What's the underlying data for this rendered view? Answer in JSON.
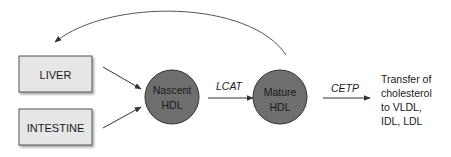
{
  "diagram": {
    "sources": [
      {
        "id": "liver",
        "label": "LIVER"
      },
      {
        "id": "intestine",
        "label": "INTESTINE"
      }
    ],
    "nodes": [
      {
        "id": "nascent",
        "line1": "Nascent",
        "line2": "HDL"
      },
      {
        "id": "mature",
        "line1": "Mature",
        "line2": "HDL"
      }
    ],
    "edges": {
      "lcat": "LCAT",
      "cetp": "CETP"
    },
    "outcome": {
      "lines": [
        "Transfer of",
        "cholesterol",
        "to VLDL,",
        "IDL, LDL"
      ]
    },
    "colors": {
      "box_fill": "#e6e6e6",
      "box_stroke": "#555555",
      "circle_fill": "#6e6e6e",
      "circle_stroke": "#333333",
      "arrow": "#333333",
      "text": "#1a1a1a"
    }
  }
}
